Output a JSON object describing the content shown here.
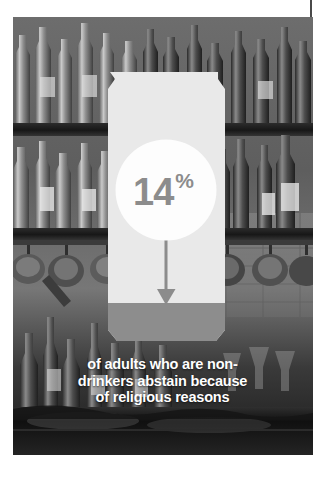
{
  "graphic": {
    "type": "statistic-infographic",
    "topic": "Non-drinkers abstaining for religious reasons",
    "stat": {
      "value": "14",
      "unit": "%",
      "full": "14%"
    },
    "caption_lines": [
      "of adults who are non-",
      "drinkers abstain because",
      "of religious reasons"
    ],
    "caption_full": "of adults who are non-drinkers abstain because of religious reasons",
    "icon_names": {
      "can": "beverage-can-icon",
      "arrow": "down-arrow-icon",
      "circle": "stat-circle"
    },
    "colors": {
      "can_body": "#e9e9e9",
      "can_base": "#8d8d8d",
      "circle": "#fdfdfd",
      "stat_text": "#8c8c8c",
      "arrow": "#8c8c8c",
      "caption_text": "#ffffff",
      "page_background": "#ffffff",
      "photo_tone": "#4e4e4e"
    },
    "photo": {
      "description": "Grayscale bar back-counter with shelves of liquor bottles and hanging cups",
      "alt": "bar-shelves-photo"
    }
  }
}
